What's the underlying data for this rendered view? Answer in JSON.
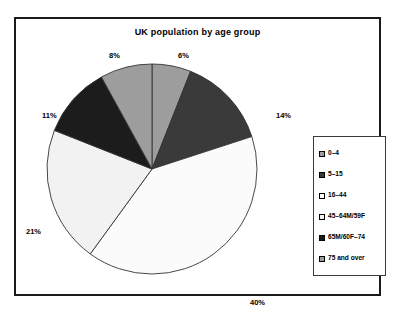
{
  "chart_data": {
    "type": "pie",
    "title": "UK population by age group",
    "xlabel": "",
    "ylabel": "",
    "legend_position": "right",
    "grid": false,
    "start_angle_deg": 0,
    "direction": "clockwise",
    "categories": [
      "0–4",
      "5–15",
      "16–44",
      "45–64M/59F",
      "65M/60F–74",
      "75 and over"
    ],
    "values": [
      6,
      14,
      40,
      21,
      11,
      8
    ],
    "labels": [
      "6%",
      "14%",
      "40%",
      "21%",
      "11%",
      "8%"
    ],
    "colors": [
      "#9d9d9d",
      "#3a3a3a",
      "#fbfbfb",
      "#f2f2f2",
      "#1c1c1c",
      "#9d9d9d"
    ],
    "slices": [
      {
        "name": "0–4",
        "value": 6,
        "label": "6%",
        "color": "#9d9d9d"
      },
      {
        "name": "5–15",
        "value": 14,
        "label": "14%",
        "color": "#3a3a3a"
      },
      {
        "name": "16–44",
        "value": 40,
        "label": "40%",
        "color": "#fbfbfb"
      },
      {
        "name": "45–64M/59F",
        "value": 21,
        "label": "21%",
        "color": "#f2f2f2"
      },
      {
        "name": "65M/60F–74",
        "value": 11,
        "label": "11%",
        "color": "#1c1c1c"
      },
      {
        "name": "75 and over",
        "value": 8,
        "label": "8%",
        "color": "#9d9d9d"
      }
    ]
  },
  "legend": {
    "items": [
      {
        "label": "0–4",
        "color": "#9d9d9d"
      },
      {
        "label": "5–15",
        "color": "#3a3a3a"
      },
      {
        "label": "16–44",
        "color": "#fbfbfb"
      },
      {
        "label": "45–64M/59F",
        "color": "#f2f2f2"
      },
      {
        "label": "65M/60F–74",
        "color": "#1c1c1c"
      },
      {
        "label": "75 and over",
        "color": "#9d9d9d"
      }
    ]
  },
  "style": {
    "frame_color": "#1a1a1a",
    "slice_outline": "#333333",
    "text_color": "#000000",
    "background": "#ffffff"
  }
}
